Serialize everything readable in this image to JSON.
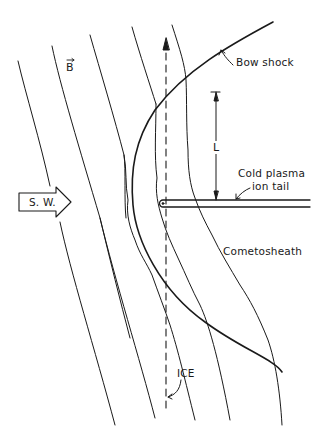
{
  "diagram": {
    "colors": {
      "ink": "#1a1a1a",
      "background": "#ffffff"
    },
    "labels": {
      "b_field": "B",
      "solar_wind": "S. W.",
      "bow_shock": "Bow shock",
      "length_scale": "L",
      "ion_tail_line1": "Cold plasma",
      "ion_tail_line2": "ion tail",
      "cometosheath": "Cometosheath",
      "ice": "ICE"
    },
    "elements": [
      "solar-wind-arrow",
      "magnetic-field-lines",
      "bow-shock-curve",
      "draped-field-lines",
      "ion-tail",
      "ice-trajectory-dashed-arrow",
      "length-scale-marker"
    ]
  }
}
